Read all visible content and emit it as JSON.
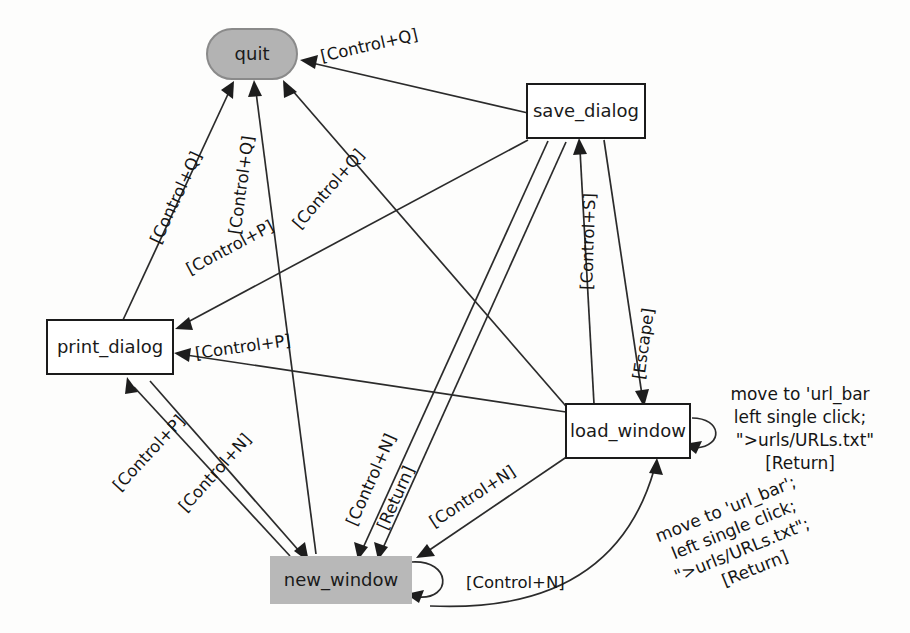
{
  "diagram": {
    "background_color": "#fdfdfc",
    "nodes": [
      {
        "id": "quit",
        "label": "quit",
        "shape": "stadium",
        "fill": "#b3b3b3",
        "border": "#8a8a8a",
        "x": 252,
        "y": 54,
        "w": 90,
        "h": 50
      },
      {
        "id": "save_dialog",
        "label": "save_dialog",
        "shape": "rect",
        "fill": "#ffffff",
        "border": "#1b1b1b",
        "x": 586,
        "y": 111,
        "w": 118,
        "h": 54
      },
      {
        "id": "print_dialog",
        "label": "print_dialog",
        "shape": "rect",
        "fill": "#ffffff",
        "border": "#1b1b1b",
        "x": 110,
        "y": 347,
        "w": 126,
        "h": 54
      },
      {
        "id": "load_window",
        "label": "load_window",
        "shape": "rect",
        "fill": "#ffffff",
        "border": "#1b1b1b",
        "x": 628,
        "y": 431,
        "w": 124,
        "h": 54
      },
      {
        "id": "new_window",
        "label": "new_window",
        "shape": "rect-filled",
        "fill": "#b8b8b8",
        "border": "none",
        "x": 341,
        "y": 580,
        "w": 142,
        "h": 48
      }
    ],
    "edges": [
      {
        "from": "save_dialog",
        "to": "quit",
        "label": "[Control+Q]"
      },
      {
        "from": "print_dialog",
        "to": "quit",
        "label": "[Control+Q]"
      },
      {
        "from": "new_window",
        "to": "quit",
        "label": "[Control+Q]"
      },
      {
        "from": "load_window",
        "to": "quit",
        "label": "[Control+Q]"
      },
      {
        "from": "new_window",
        "to": "print_dialog",
        "label": "[Control+P]"
      },
      {
        "from": "load_window",
        "to": "print_dialog",
        "label": "[Control+P]"
      },
      {
        "from": "save_dialog",
        "to": "print_dialog",
        "label": "[Control+P]"
      },
      {
        "from": "load_window",
        "to": "save_dialog",
        "label": "[Control+S]"
      },
      {
        "from": "save_dialog",
        "to": "load_window",
        "label": "[Escape]"
      },
      {
        "from": "print_dialog",
        "to": "new_window",
        "label": "[Control+N]"
      },
      {
        "from": "save_dialog",
        "to": "new_window",
        "label": "[Control+N]"
      },
      {
        "from": "load_window",
        "to": "new_window",
        "label": "[Control+N]"
      },
      {
        "from": "save_dialog",
        "to": "new_window",
        "label": "[Return]"
      },
      {
        "from": "new_window",
        "to": "new_window",
        "label": "[Control+N]",
        "self_loop": true
      },
      {
        "from": "load_window",
        "to": "load_window",
        "label": "move to 'url_bar\nleft single click;\n\">urls/URLs.txt\"\n[Return]",
        "self_loop": true
      },
      {
        "from": "new_window",
        "to": "load_window",
        "label": "move to 'url_bar';\nleft single click;\n\">urls/URLs.txt\";\n[Return]"
      }
    ],
    "labels": {
      "ctrl_q_1": "[Control+Q]",
      "ctrl_q_2": "[Control+Q]",
      "ctrl_q_3": "[Control+Q]",
      "ctrl_q_4": "[Control+Q]",
      "ctrl_p_1": "[Control+P]",
      "ctrl_p_2": "[Control+P]",
      "ctrl_p_3": "[Control+P]",
      "ctrl_s": "[Control+S]",
      "escape": "[Escape]",
      "ctrl_n_1": "[Control+N]",
      "ctrl_n_2": "[Control+N]",
      "ctrl_n_3": "[Control+N]",
      "ctrl_n_self": "[Control+N]",
      "return_1": "[Return]",
      "load_self_line1": "move to 'url_bar",
      "load_self_line2": "left single click;",
      "load_self_line3": "\">urls/URLs.txt\"",
      "load_self_line4": "[Return]",
      "new_to_load_line1": "move to 'url_bar';",
      "new_to_load_line2": "left single click;",
      "new_to_load_line3": "\">urls/URLs.txt\";",
      "new_to_load_line4": "[Return]"
    },
    "node_labels": {
      "quit": "quit",
      "save_dialog": "save_dialog",
      "print_dialog": "print_dialog",
      "load_window": "load_window",
      "new_window": "new_window"
    }
  }
}
